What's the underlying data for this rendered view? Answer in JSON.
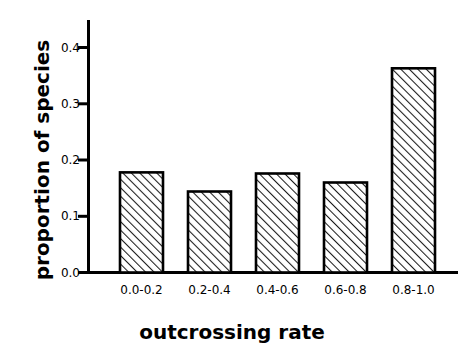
{
  "chart_data": {
    "type": "bar",
    "title": "",
    "xlabel": "outcrossing rate",
    "ylabel": "proportion of species",
    "categories": [
      "0.0-0.2",
      "0.2-0.4",
      "0.4-0.6",
      "0.6-0.8",
      "0.8-1.0"
    ],
    "values": [
      0.178,
      0.144,
      0.176,
      0.16,
      0.363
    ],
    "ylim": [
      0.0,
      0.44
    ],
    "yticks": [
      0.0,
      0.1,
      0.2,
      0.3,
      0.4
    ],
    "ytick_labels": [
      "0.0",
      "0.1",
      "0.2",
      "0.3",
      "0.4"
    ],
    "grid": false,
    "legend": null,
    "bar_fill": "#ffffff",
    "bar_hatch": "diagonal-forward",
    "bar_edge_color": "#000000",
    "axis_color": "#000000"
  }
}
